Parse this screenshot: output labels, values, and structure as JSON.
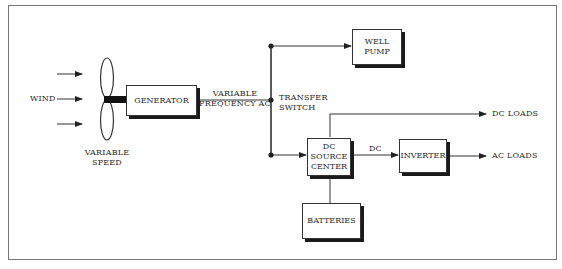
{
  "diagram": {
    "type": "block-diagram",
    "nodes": [
      {
        "id": "wind",
        "label": "WIND"
      },
      {
        "id": "turbine",
        "label": "VARIABLE SPEED",
        "line1": "VARIABLE",
        "line2": "SPEED"
      },
      {
        "id": "generator",
        "label": "GENERATOR"
      },
      {
        "id": "transfer_switch",
        "label": "TRANSFER SWITCH",
        "line1": "TRANSFER",
        "line2": "SWITCH"
      },
      {
        "id": "well_pump",
        "label": "WELL PUMP",
        "line1": "WELL",
        "line2": "PUMP"
      },
      {
        "id": "dc_source_center",
        "label": "DC SOURCE CENTER",
        "line1": "DC",
        "line2": "SOURCE",
        "line3": "CENTER"
      },
      {
        "id": "batteries",
        "label": "BATTERIES"
      },
      {
        "id": "inverter",
        "label": "INVERTER"
      },
      {
        "id": "dc_loads",
        "label": "DC LOADS"
      },
      {
        "id": "ac_loads",
        "label": "AC LOADS"
      }
    ],
    "edges": [
      {
        "from": "wind",
        "to": "turbine",
        "label": ""
      },
      {
        "from": "turbine",
        "to": "generator",
        "label": "shaft"
      },
      {
        "from": "generator",
        "to": "transfer_switch",
        "label": "VARIABLE FREQUENCY AC",
        "line1": "VARIABLE",
        "line2": "FREQUENCY  AC"
      },
      {
        "from": "transfer_switch",
        "to": "well_pump",
        "label": ""
      },
      {
        "from": "transfer_switch",
        "to": "dc_source_center",
        "label": ""
      },
      {
        "from": "dc_source_center",
        "to": "inverter",
        "label": "DC"
      },
      {
        "from": "dc_source_center",
        "to": "dc_loads",
        "label": ""
      },
      {
        "from": "inverter",
        "to": "ac_loads",
        "label": ""
      },
      {
        "from": "batteries",
        "to": "dc_source_center",
        "label": ""
      }
    ]
  }
}
